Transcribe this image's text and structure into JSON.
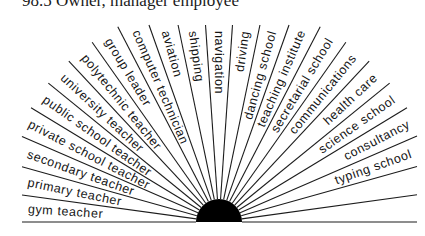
{
  "header": {
    "text": "98.5 Owner, manager employee"
  },
  "diagram": {
    "center": {
      "x": 219,
      "y": 222
    },
    "hub_radius": 23,
    "ray_color": "#1c1c1c",
    "hub_color": "#000000",
    "wedge_count": 23,
    "labels_left": [
      "gym teacher",
      "primary teacher",
      "secondary teacher",
      "private school teacher",
      "public school teacher",
      "university teacher",
      "polytechnic teacher",
      "group leader",
      "computer technician",
      "aviation",
      "shipping",
      "navigation"
    ],
    "labels_right": [
      "driving",
      "dancing school",
      "teaching institute",
      "secretarial school",
      "communications",
      "health care",
      "science school",
      "consultancy",
      "typing school",
      "",
      ""
    ]
  }
}
